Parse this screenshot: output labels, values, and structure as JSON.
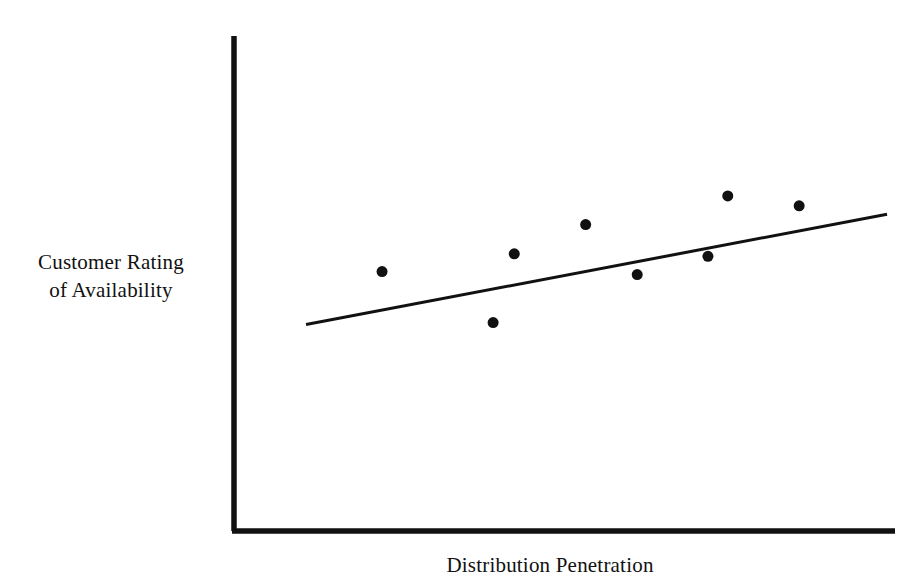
{
  "figure": {
    "background_color": "#ffffff",
    "ink_color": "#111111"
  },
  "axes": {
    "y_axis_label_line1": "Customer Rating",
    "y_axis_label_line2": "of Availability",
    "x_axis_label": "Distribution Penetration"
  },
  "chart_data": {
    "type": "scatter",
    "title": "",
    "xlabel": "Distribution Penetration",
    "ylabel": "Customer Rating of Availability",
    "xlim": [
      0,
      100
    ],
    "ylim": [
      0,
      100
    ],
    "grid": false,
    "legend": null,
    "axis_ticks": {
      "x": [],
      "y": []
    },
    "points": [
      {
        "x": 22.4,
        "y": 52.4
      },
      {
        "x": 39.2,
        "y": 42.1
      },
      {
        "x": 42.4,
        "y": 56.0
      },
      {
        "x": 53.2,
        "y": 61.9
      },
      {
        "x": 61.0,
        "y": 51.8
      },
      {
        "x": 71.7,
        "y": 55.5
      },
      {
        "x": 74.7,
        "y": 67.7
      },
      {
        "x": 85.5,
        "y": 65.7
      }
    ],
    "marker": {
      "shape": "circle",
      "color": "#111111",
      "size_px": 11
    },
    "trendline": {
      "type": "linear-fit",
      "color": "#111111",
      "width_px": 3,
      "x_start": 10.9,
      "y_start": 41.7,
      "x_end": 98.8,
      "y_end": 64.0
    }
  }
}
